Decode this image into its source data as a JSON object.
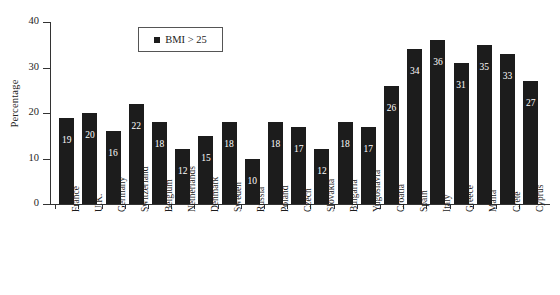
{
  "chart_data": {
    "type": "bar",
    "title": "",
    "subtitle": "",
    "xlabel": "",
    "ylabel": "Percentage",
    "ylim": [
      0,
      40
    ],
    "yticks": [
      0,
      10,
      20,
      30,
      40
    ],
    "grid": false,
    "legend_position": "top-left-inset",
    "legend": [
      "BMI > 25"
    ],
    "bar_color": "#1c1c1c",
    "value_label_color": "#ffffff",
    "categories": [
      "France",
      "U.K.",
      "Germany",
      "Switzerland",
      "Belgium",
      "Netherlands",
      "Denmark",
      "Sweden",
      "Russia",
      "Poland",
      "Czech",
      "Slovakia",
      "Bulgaria",
      "Yugoslavia",
      "Croatia",
      "Spain",
      "Italy",
      "Greece",
      "Malta",
      "Crete",
      "Cyprus"
    ],
    "values": [
      19,
      20,
      16,
      22,
      18,
      12,
      15,
      18,
      10,
      18,
      17,
      12,
      18,
      17,
      26,
      34,
      36,
      31,
      35,
      33,
      27
    ],
    "series": [
      {
        "name": "BMI > 25",
        "values": [
          19,
          20,
          16,
          22,
          18,
          12,
          15,
          18,
          10,
          18,
          17,
          12,
          18,
          17,
          26,
          34,
          36,
          31,
          35,
          33,
          27
        ]
      }
    ]
  },
  "legend": {
    "label": "BMI > 25",
    "swatch_color": "#1c1c1c"
  }
}
